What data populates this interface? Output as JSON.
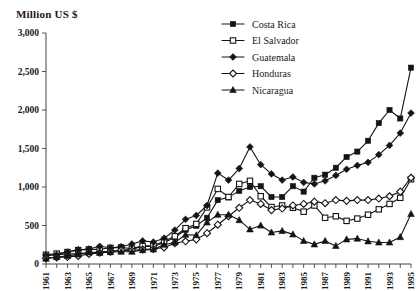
{
  "chart_data": {
    "type": "line",
    "title": "Million US $",
    "xlabel": "",
    "ylabel": "Million US $",
    "ylim": [
      0,
      3000
    ],
    "yticks": [
      0,
      500,
      1000,
      1500,
      2000,
      2500,
      3000
    ],
    "ytick_labels": [
      "0",
      "500",
      "1,000",
      "1,500",
      "2,000",
      "2,500",
      "3,000"
    ],
    "xlim": [
      1961,
      1995
    ],
    "x": [
      1961,
      1962,
      1963,
      1964,
      1965,
      1966,
      1967,
      1968,
      1969,
      1970,
      1971,
      1972,
      1973,
      1974,
      1975,
      1976,
      1977,
      1978,
      1979,
      1980,
      1981,
      1982,
      1983,
      1984,
      1985,
      1986,
      1987,
      1988,
      1989,
      1990,
      1991,
      1992,
      1993,
      1994,
      1995
    ],
    "xtick_labels": [
      "1961",
      "1963",
      "1965",
      "1967",
      "1969",
      "1971",
      "1973",
      "1975",
      "1977",
      "1979",
      "1981",
      "1983",
      "1985",
      "1987",
      "1989",
      "1991",
      "1993",
      "1995"
    ],
    "xtick_label_years": [
      1961,
      1963,
      1965,
      1967,
      1969,
      1971,
      1973,
      1975,
      1977,
      1979,
      1981,
      1983,
      1985,
      1987,
      1989,
      1991,
      1993,
      1995
    ],
    "grid": false,
    "legend_position": "top-right",
    "series": [
      {
        "name": "Costa Rica",
        "marker": "filled-square",
        "values": [
          110,
          120,
          130,
          135,
          145,
          160,
          165,
          175,
          190,
          230,
          225,
          280,
          345,
          445,
          495,
          600,
          830,
          865,
          950,
          1000,
          1010,
          870,
          870,
          1010,
          940,
          1120,
          1160,
          1250,
          1390,
          1460,
          1600,
          1830,
          2000,
          1890,
          2550
        ]
      },
      {
        "name": "El Salvador",
        "marker": "open-square",
        "values": [
          120,
          135,
          155,
          180,
          190,
          190,
          210,
          215,
          200,
          235,
          240,
          295,
          360,
          465,
          520,
          735,
          975,
          870,
          1040,
          1080,
          880,
          740,
          760,
          730,
          680,
          760,
          600,
          620,
          560,
          590,
          640,
          710,
          780,
          860,
          1100
        ]
      },
      {
        "name": "Guatemala",
        "marker": "filled-diamond",
        "values": [
          115,
          120,
          155,
          185,
          195,
          230,
          210,
          225,
          260,
          300,
          285,
          335,
          440,
          580,
          630,
          760,
          1180,
          1090,
          1240,
          1520,
          1290,
          1170,
          1090,
          1130,
          1060,
          1040,
          1080,
          1150,
          1230,
          1280,
          1320,
          1420,
          1540,
          1700,
          1960
        ]
      },
      {
        "name": "Honduras",
        "marker": "open-diamond",
        "values": [
          75,
          85,
          90,
          105,
          130,
          145,
          160,
          180,
          175,
          190,
          195,
          215,
          270,
          295,
          320,
          400,
          510,
          620,
          730,
          830,
          780,
          700,
          720,
          760,
          780,
          810,
          790,
          830,
          820,
          830,
          830,
          850,
          880,
          940,
          1120
        ]
      },
      {
        "name": "Nicaragua",
        "marker": "filled-triangle",
        "values": [
          70,
          90,
          105,
          125,
          150,
          145,
          155,
          160,
          160,
          180,
          190,
          250,
          280,
          380,
          375,
          540,
          640,
          640,
          570,
          450,
          500,
          410,
          430,
          385,
          300,
          255,
          300,
          235,
          320,
          330,
          295,
          280,
          280,
          350,
          650
        ]
      }
    ]
  },
  "legend": {
    "items": [
      {
        "label": "Costa Rica"
      },
      {
        "label": "El Salvador"
      },
      {
        "label": "Guatemala"
      },
      {
        "label": "Honduras"
      },
      {
        "label": "Nicaragua"
      }
    ]
  },
  "colors": {
    "ink": "#141414",
    "axis": "#444444",
    "background": "#ffffff"
  }
}
